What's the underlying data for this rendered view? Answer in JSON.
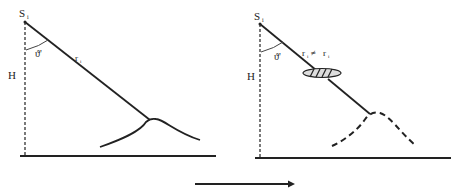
{
  "left_panel": {
    "source_label": "S",
    "source_subscript": "i",
    "angle_label": "ϑ'",
    "height_label": "H",
    "ray_label": "r",
    "ray_subscript": "i"
  },
  "right_panel": {
    "source_label": "S",
    "source_subscript": "i",
    "angle_label": "ϑ'",
    "height_label": "H",
    "ray_label_left": "r",
    "ray_label_left_subscript": "i",
    "relation_symbol": "≠",
    "ray_label_right": "r",
    "ray_label_right_subscript": "i"
  },
  "arrow": {
    "direction": "right"
  }
}
